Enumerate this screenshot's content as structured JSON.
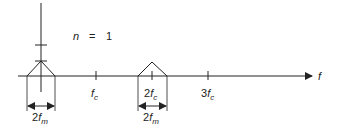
{
  "title": "n = 1",
  "annotation": {
    "var": "n",
    "eq": "=",
    "value": "1"
  },
  "axis": {
    "label": "f"
  },
  "ticks": [
    {
      "coef": "",
      "sym": "f",
      "sub": "c"
    },
    {
      "coef": "2",
      "sym": "f",
      "sub": "c"
    },
    {
      "coef": "3",
      "sym": "f",
      "sub": "c"
    }
  ],
  "bandwidth_labels": [
    {
      "coef": "2",
      "sym": "f",
      "sub": "m"
    },
    {
      "coef": "2",
      "sym": "f",
      "sub": "m"
    }
  ],
  "colors": {
    "line": "#222222",
    "background": "#ffffff"
  }
}
